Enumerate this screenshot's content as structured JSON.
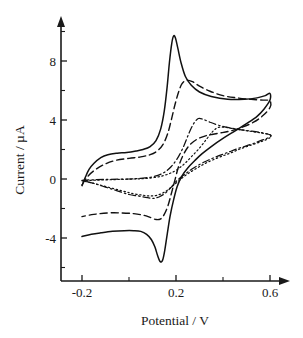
{
  "chart_data": {
    "type": "line",
    "title": "",
    "xlabel": "Potential / V",
    "ylabel": "Current / µA",
    "xlim": [
      -0.26,
      0.66
    ],
    "ylim": [
      -7.2,
      10.6
    ],
    "xticks": [
      -0.2,
      0.0,
      0.2,
      0.4,
      0.6
    ],
    "xtick_labels": [
      "-0.2",
      "",
      "0.2",
      "",
      "0.6"
    ],
    "yticks": [
      -6,
      -4,
      -2,
      0,
      2,
      4,
      6,
      8,
      10
    ],
    "ytick_labels": [
      "",
      "-4",
      "",
      "0",
      "",
      "4",
      "",
      "8",
      ""
    ],
    "grid": false,
    "legend": "none",
    "axis_style": "arrow-tipped half-axes",
    "series": [
      {
        "name": "curve-1",
        "linestyle": "solid",
        "anodic_peak": {
          "potential": 0.19,
          "current": 9.7
        },
        "cathodic_peak": {
          "potential": 0.13,
          "current": -5.6
        },
        "points": [
          [
            -0.2,
            -0.45
          ],
          [
            -0.185,
            0.15
          ],
          [
            -0.17,
            0.65
          ],
          [
            -0.15,
            1.05
          ],
          [
            -0.12,
            1.45
          ],
          [
            -0.09,
            1.65
          ],
          [
            -0.05,
            1.75
          ],
          [
            -0.01,
            1.8
          ],
          [
            0.03,
            1.9
          ],
          [
            0.06,
            2.0
          ],
          [
            0.09,
            2.2
          ],
          [
            0.115,
            2.6
          ],
          [
            0.135,
            3.4
          ],
          [
            0.15,
            4.6
          ],
          [
            0.162,
            6.2
          ],
          [
            0.172,
            7.9
          ],
          [
            0.182,
            9.2
          ],
          [
            0.19,
            9.7
          ],
          [
            0.198,
            9.55
          ],
          [
            0.208,
            8.85
          ],
          [
            0.222,
            7.85
          ],
          [
            0.24,
            6.95
          ],
          [
            0.265,
            6.35
          ],
          [
            0.3,
            5.9
          ],
          [
            0.35,
            5.6
          ],
          [
            0.42,
            5.4
          ],
          [
            0.49,
            5.4
          ],
          [
            0.545,
            5.5
          ],
          [
            0.58,
            5.65
          ],
          [
            0.6,
            5.8
          ],
          [
            0.6,
            5.35
          ],
          [
            0.575,
            4.75
          ],
          [
            0.545,
            4.25
          ],
          [
            0.5,
            3.75
          ],
          [
            0.45,
            3.25
          ],
          [
            0.4,
            2.75
          ],
          [
            0.35,
            2.2
          ],
          [
            0.31,
            1.7
          ],
          [
            0.28,
            1.25
          ],
          [
            0.25,
            0.75
          ],
          [
            0.225,
            0.2
          ],
          [
            0.205,
            -0.5
          ],
          [
            0.19,
            -1.4
          ],
          [
            0.175,
            -2.5
          ],
          [
            0.163,
            -3.7
          ],
          [
            0.152,
            -4.85
          ],
          [
            0.143,
            -5.5
          ],
          [
            0.133,
            -5.6
          ],
          [
            0.122,
            -5.2
          ],
          [
            0.11,
            -4.6
          ],
          [
            0.095,
            -4.1
          ],
          [
            0.075,
            -3.75
          ],
          [
            0.05,
            -3.55
          ],
          [
            0.02,
            -3.5
          ],
          [
            -0.02,
            -3.5
          ],
          [
            -0.07,
            -3.55
          ],
          [
            -0.12,
            -3.65
          ],
          [
            -0.16,
            -3.75
          ],
          [
            -0.2,
            -3.9
          ]
        ]
      },
      {
        "name": "curve-2",
        "linestyle": "dashed",
        "anodic_peak": {
          "potential": 0.245,
          "current": 6.7
        },
        "cathodic_peak": {
          "potential": 0.115,
          "current": -2.75
        },
        "points": [
          [
            -0.2,
            -0.4
          ],
          [
            -0.18,
            0.1
          ],
          [
            -0.15,
            0.55
          ],
          [
            -0.11,
            0.95
          ],
          [
            -0.06,
            1.25
          ],
          [
            0.0,
            1.4
          ],
          [
            0.05,
            1.5
          ],
          [
            0.09,
            1.65
          ],
          [
            0.12,
            1.9
          ],
          [
            0.145,
            2.35
          ],
          [
            0.165,
            3.1
          ],
          [
            0.18,
            4.0
          ],
          [
            0.195,
            5.0
          ],
          [
            0.21,
            5.85
          ],
          [
            0.225,
            6.45
          ],
          [
            0.245,
            6.7
          ],
          [
            0.27,
            6.6
          ],
          [
            0.3,
            6.3
          ],
          [
            0.345,
            5.95
          ],
          [
            0.4,
            5.65
          ],
          [
            0.46,
            5.5
          ],
          [
            0.52,
            5.4
          ],
          [
            0.57,
            5.35
          ],
          [
            0.6,
            5.3
          ],
          [
            0.6,
            4.85
          ],
          [
            0.57,
            4.3
          ],
          [
            0.53,
            3.85
          ],
          [
            0.48,
            3.5
          ],
          [
            0.43,
            3.25
          ],
          [
            0.38,
            3.1
          ],
          [
            0.33,
            2.95
          ],
          [
            0.29,
            2.7
          ],
          [
            0.255,
            2.25
          ],
          [
            0.23,
            1.6
          ],
          [
            0.21,
            0.8
          ],
          [
            0.195,
            -0.1
          ],
          [
            0.18,
            -1.0
          ],
          [
            0.165,
            -1.85
          ],
          [
            0.15,
            -2.4
          ],
          [
            0.135,
            -2.7
          ],
          [
            0.115,
            -2.75
          ],
          [
            0.09,
            -2.6
          ],
          [
            0.06,
            -2.45
          ],
          [
            0.02,
            -2.35
          ],
          [
            -0.03,
            -2.3
          ],
          [
            -0.09,
            -2.3
          ],
          [
            -0.15,
            -2.4
          ],
          [
            -0.2,
            -2.55
          ]
        ]
      },
      {
        "name": "curve-3",
        "linestyle": "dash-dot",
        "anodic_peak": {
          "potential": 0.3,
          "current": 4.1
        },
        "cathodic_peak": {
          "potential": 0.095,
          "current": -1.3
        },
        "points": [
          [
            -0.2,
            -0.1
          ],
          [
            -0.15,
            -0.05
          ],
          [
            -0.08,
            -0.02
          ],
          [
            0.0,
            0.0
          ],
          [
            0.05,
            0.05
          ],
          [
            0.1,
            0.15
          ],
          [
            0.145,
            0.4
          ],
          [
            0.18,
            0.85
          ],
          [
            0.21,
            1.5
          ],
          [
            0.235,
            2.3
          ],
          [
            0.255,
            3.1
          ],
          [
            0.275,
            3.75
          ],
          [
            0.295,
            4.1
          ],
          [
            0.315,
            4.05
          ],
          [
            0.345,
            3.85
          ],
          [
            0.38,
            3.65
          ],
          [
            0.42,
            3.5
          ],
          [
            0.47,
            3.35
          ],
          [
            0.52,
            3.25
          ],
          [
            0.56,
            3.15
          ],
          [
            0.6,
            3.0
          ],
          [
            0.6,
            2.85
          ],
          [
            0.56,
            2.6
          ],
          [
            0.52,
            2.35
          ],
          [
            0.47,
            2.1
          ],
          [
            0.42,
            1.8
          ],
          [
            0.37,
            1.5
          ],
          [
            0.32,
            1.15
          ],
          [
            0.275,
            0.75
          ],
          [
            0.24,
            0.35
          ],
          [
            0.205,
            -0.1
          ],
          [
            0.18,
            -0.55
          ],
          [
            0.155,
            -0.95
          ],
          [
            0.13,
            -1.2
          ],
          [
            0.11,
            -1.3
          ],
          [
            0.095,
            -1.3
          ],
          [
            0.07,
            -1.25
          ],
          [
            0.04,
            -1.15
          ],
          [
            0.0,
            -1.05
          ],
          [
            -0.05,
            -0.8
          ],
          [
            -0.1,
            -0.55
          ],
          [
            -0.15,
            -0.3
          ],
          [
            -0.2,
            -0.1
          ]
        ]
      },
      {
        "name": "curve-4",
        "linestyle": "dotted",
        "anodic_peak": {
          "potential": 0.38,
          "current": 3.5
        },
        "cathodic_peak": {
          "potential": 0.09,
          "current": -1.15
        },
        "points": [
          [
            -0.2,
            -0.12
          ],
          [
            -0.14,
            -0.08
          ],
          [
            -0.06,
            -0.04
          ],
          [
            0.02,
            0.0
          ],
          [
            0.08,
            0.05
          ],
          [
            0.14,
            0.2
          ],
          [
            0.19,
            0.5
          ],
          [
            0.23,
            0.95
          ],
          [
            0.265,
            1.5
          ],
          [
            0.3,
            2.1
          ],
          [
            0.33,
            2.7
          ],
          [
            0.355,
            3.2
          ],
          [
            0.38,
            3.5
          ],
          [
            0.41,
            3.5
          ],
          [
            0.45,
            3.4
          ],
          [
            0.49,
            3.3
          ],
          [
            0.53,
            3.2
          ],
          [
            0.57,
            3.1
          ],
          [
            0.6,
            3.0
          ],
          [
            0.6,
            2.8
          ],
          [
            0.565,
            2.55
          ],
          [
            0.52,
            2.3
          ],
          [
            0.475,
            2.05
          ],
          [
            0.43,
            1.75
          ],
          [
            0.38,
            1.45
          ],
          [
            0.33,
            1.1
          ],
          [
            0.285,
            0.7
          ],
          [
            0.245,
            0.3
          ],
          [
            0.21,
            -0.15
          ],
          [
            0.18,
            -0.55
          ],
          [
            0.15,
            -0.9
          ],
          [
            0.12,
            -1.1
          ],
          [
            0.09,
            -1.15
          ],
          [
            0.06,
            -1.1
          ],
          [
            0.02,
            -1.0
          ],
          [
            -0.03,
            -0.8
          ],
          [
            -0.09,
            -0.55
          ],
          [
            -0.15,
            -0.3
          ],
          [
            -0.2,
            -0.12
          ]
        ]
      }
    ]
  },
  "figure": {
    "background_color": "#ffffff",
    "line_color": "#111111"
  }
}
